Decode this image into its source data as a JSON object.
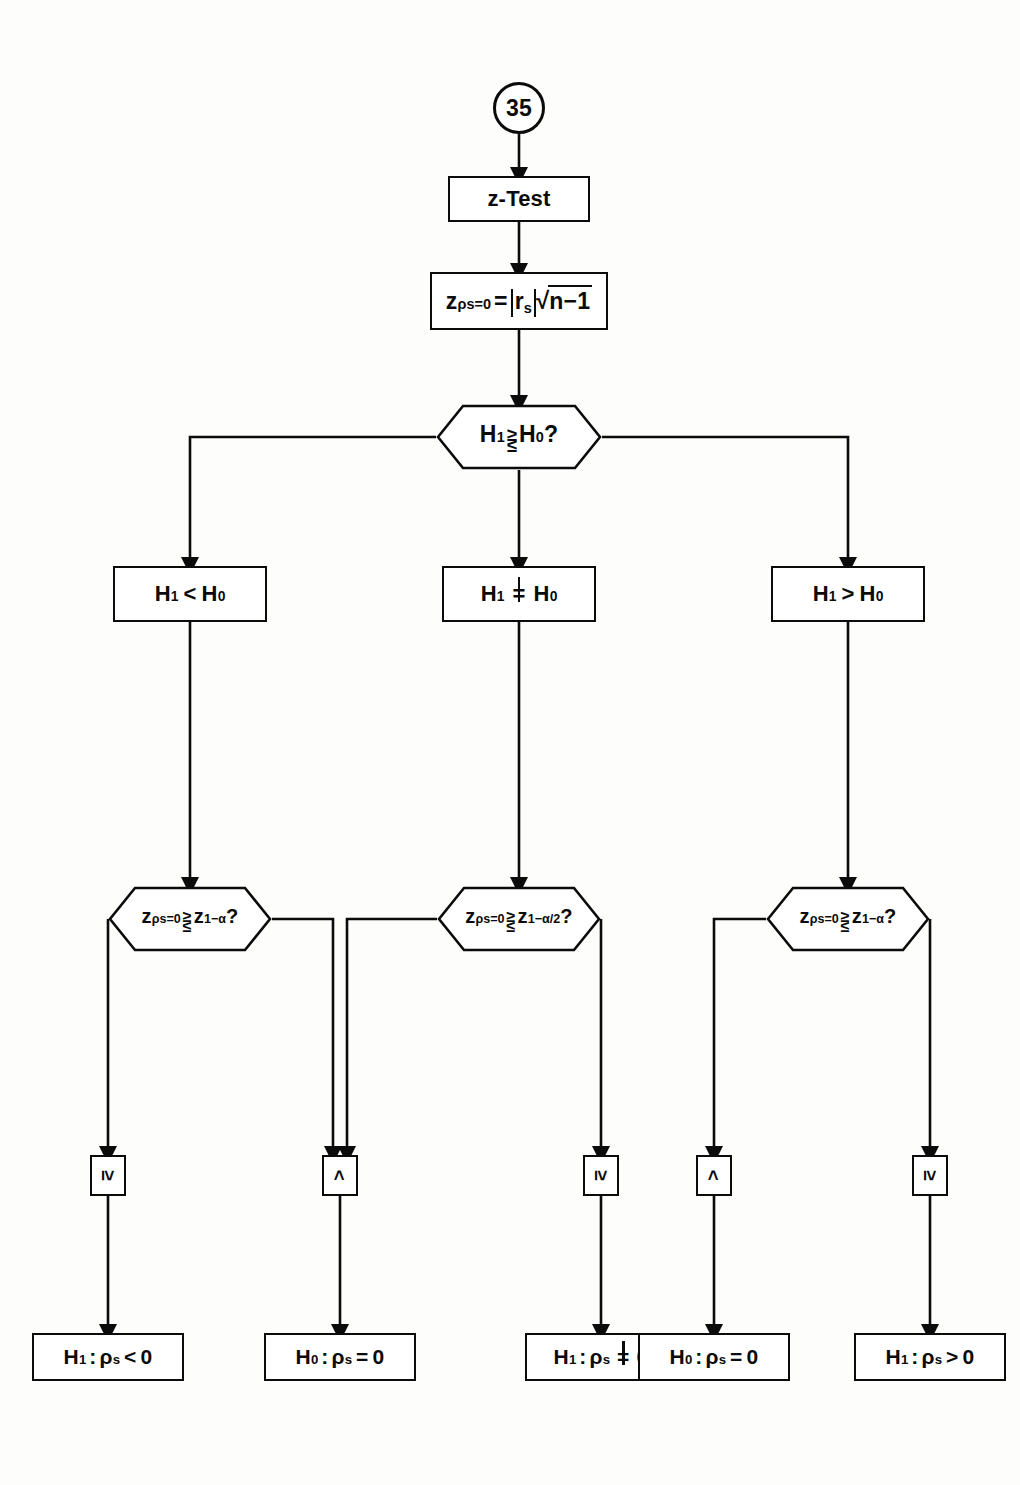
{
  "diagram": {
    "page_connector": "35",
    "stroke_color": "#0b0b0b",
    "background_color": "#fdfdfc"
  },
  "nodes": {
    "connector_in": {
      "label": "35",
      "shape": "circle"
    },
    "test_name": {
      "label": "z-Test",
      "shape": "rect"
    },
    "statistic": {
      "shape": "rect",
      "var": "z",
      "var_sub": "ρs=0",
      "equals": "=",
      "abs": "r",
      "abs_sub": "s",
      "radicand": "n−1",
      "plain": "z_{ρs=0} = |r_s| √(n−1)"
    },
    "hypothesis_decision": {
      "shape": "hexagon",
      "left": "H",
      "left_sub": "1",
      "rel_top": "≥",
      "rel_bottom": "≤",
      "right": "H",
      "right_sub": "0",
      "suffix": "?",
      "plain": "H₁ ≷ H₀ ?"
    },
    "branch_less": {
      "shape": "rect",
      "h1": "H",
      "h1_sub": "1",
      "op": "<",
      "h0": "H",
      "h0_sub": "0",
      "plain": "H₁ < H₀"
    },
    "branch_noteq": {
      "shape": "rect",
      "h1": "H",
      "h1_sub": "1",
      "op": "=",
      "op_kind": "not-equal",
      "h0": "H",
      "h0_sub": "0",
      "plain": "H₁ ≠ H₀"
    },
    "branch_greater": {
      "shape": "rect",
      "h1": "H",
      "h1_sub": "1",
      "op": ">",
      "h0": "H",
      "h0_sub": "0",
      "plain": "H₁ > H₀"
    },
    "crit_left": {
      "shape": "hexagon",
      "var": "z",
      "var_sub": "ρs=0",
      "rel_top": "≥",
      "rel_bottom": "≤",
      "crit": "z",
      "crit_sub": "1−α",
      "suffix": "?",
      "plain": "z_{ρs=0} ≷ z_{1−α} ?"
    },
    "crit_mid": {
      "shape": "hexagon",
      "var": "z",
      "var_sub": "ρs=0",
      "rel_top": "≥",
      "rel_bottom": "≤",
      "crit": "z",
      "crit_sub": "1−α/2",
      "suffix": "?",
      "plain": "z_{ρs=0} ≷ z_{1−α/2} ?"
    },
    "crit_right": {
      "shape": "hexagon",
      "var": "z",
      "var_sub": "ρs=0",
      "rel_top": "≥",
      "rel_bottom": "≤",
      "crit": "z",
      "crit_sub": "1−α",
      "suffix": "?",
      "plain": "z_{ρs=0} ≷ z_{1−α} ?"
    },
    "gate_1": {
      "label": "≥",
      "shape": "small-rect"
    },
    "gate_2": {
      "label": "<",
      "shape": "small-rect"
    },
    "gate_3": {
      "label": "≥",
      "shape": "small-rect"
    },
    "gate_4": {
      "label": "<",
      "shape": "small-rect"
    },
    "gate_5": {
      "label": "≥",
      "shape": "small-rect"
    },
    "result_1": {
      "shape": "rect",
      "h": "H",
      "h_sub": "1",
      "sep": ":",
      "rho": "ρ",
      "rho_sub": "s",
      "op": "<",
      "value": "0",
      "plain": "H₁ : ρs < 0"
    },
    "result_2": {
      "shape": "rect",
      "h": "H",
      "h_sub": "0",
      "sep": ":",
      "rho": "ρ",
      "rho_sub": "s",
      "op": "=",
      "value": "0",
      "plain": "H₀ : ρs = 0"
    },
    "result_3": {
      "shape": "rect",
      "h": "H",
      "h_sub": "1",
      "sep": ":",
      "rho": "ρ",
      "rho_sub": "s",
      "op": "=",
      "op_kind": "not-equal",
      "value": "0",
      "plain": "H₁ : ρs ≠ 0"
    },
    "result_4": {
      "shape": "rect",
      "h": "H",
      "h_sub": "0",
      "sep": ":",
      "rho": "ρ",
      "rho_sub": "s",
      "op": "=",
      "value": "0",
      "plain": "H₀ : ρs = 0"
    },
    "result_5": {
      "shape": "rect",
      "h": "H",
      "h_sub": "1",
      "sep": ":",
      "rho": "ρ",
      "rho_sub": "s",
      "op": ">",
      "value": "0",
      "plain": "H₁ : ρs > 0"
    }
  }
}
